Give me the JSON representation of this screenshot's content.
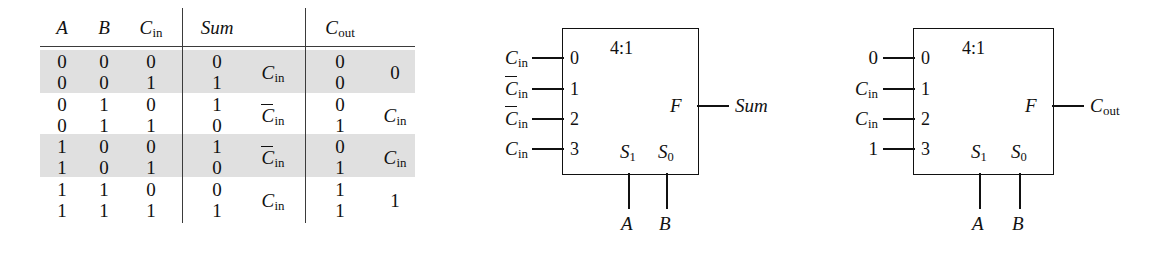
{
  "figure": {
    "kind": "logic-diagram"
  },
  "truth_table": {
    "headers": [
      "A",
      "B",
      "C_in",
      "Sum",
      "C_out"
    ],
    "header_glyphs": [
      {
        "base": "A",
        "sub": "",
        "bar": false
      },
      {
        "base": "B",
        "sub": "",
        "bar": false
      },
      {
        "base": "C",
        "sub": "in",
        "bar": false
      },
      {
        "base": "Sum",
        "sub": "",
        "bar": false
      },
      {
        "base": "C",
        "sub": "out",
        "bar": false
      }
    ],
    "rows": [
      {
        "a": "0",
        "b": "0",
        "cin": "0",
        "sum": "0",
        "cout": "0"
      },
      {
        "a": "0",
        "b": "0",
        "cin": "1",
        "sum": "1",
        "cout": "0"
      },
      {
        "a": "0",
        "b": "1",
        "cin": "0",
        "sum": "1",
        "cout": "0"
      },
      {
        "a": "0",
        "b": "1",
        "cin": "1",
        "sum": "0",
        "cout": "1"
      },
      {
        "a": "1",
        "b": "0",
        "cin": "0",
        "sum": "1",
        "cout": "0"
      },
      {
        "a": "1",
        "b": "0",
        "cin": "1",
        "sum": "0",
        "cout": "1"
      },
      {
        "a": "1",
        "b": "1",
        "cin": "0",
        "sum": "0",
        "cout": "1"
      },
      {
        "a": "1",
        "b": "1",
        "cin": "1",
        "sum": "1",
        "cout": "1"
      }
    ],
    "group_expressions": [
      {
        "ab": "00",
        "sum": {
          "base": "C",
          "sub": "in",
          "bar": false
        },
        "cout": {
          "base": "0",
          "sub": "",
          "bar": false
        }
      },
      {
        "ab": "01",
        "sum": {
          "base": "C",
          "sub": "in",
          "bar": true
        },
        "cout": {
          "base": "C",
          "sub": "in",
          "bar": false
        }
      },
      {
        "ab": "10",
        "sum": {
          "base": "C",
          "sub": "in",
          "bar": true
        },
        "cout": {
          "base": "C",
          "sub": "in",
          "bar": false
        }
      },
      {
        "ab": "11",
        "sum": {
          "base": "C",
          "sub": "in",
          "bar": false
        },
        "cout": {
          "base": "1",
          "sub": "",
          "bar": false
        }
      }
    ],
    "shaded_groups": [
      0,
      2
    ]
  },
  "mux_sum": {
    "title": "4:1",
    "output_pin": "F",
    "output_label": "Sum",
    "select_labels": [
      "S",
      "S"
    ],
    "select_subs": [
      "1",
      "0"
    ],
    "select_sources": [
      "A",
      "B"
    ],
    "input_indices": [
      "0",
      "1",
      "2",
      "3"
    ],
    "inputs": [
      {
        "base": "C",
        "sub": "in",
        "bar": false
      },
      {
        "base": "C",
        "sub": "in",
        "bar": true
      },
      {
        "base": "C",
        "sub": "in",
        "bar": true
      },
      {
        "base": "C",
        "sub": "in",
        "bar": false
      }
    ]
  },
  "mux_cout": {
    "title": "4:1",
    "output_pin": "F",
    "output_label": "C_out",
    "output_glyph": {
      "base": "C",
      "sub": "out",
      "bar": false
    },
    "select_labels": [
      "S",
      "S"
    ],
    "select_subs": [
      "1",
      "0"
    ],
    "select_sources": [
      "A",
      "B"
    ],
    "input_indices": [
      "0",
      "1",
      "2",
      "3"
    ],
    "inputs": [
      {
        "base": "0",
        "sub": "",
        "bar": false
      },
      {
        "base": "C",
        "sub": "in",
        "bar": false
      },
      {
        "base": "C",
        "sub": "in",
        "bar": false
      },
      {
        "base": "1",
        "sub": "",
        "bar": false
      }
    ]
  },
  "colors": {
    "ink": "#111111",
    "shade": "#e0e0e0",
    "rule": "#3b3b3b",
    "background": "#ffffff"
  }
}
